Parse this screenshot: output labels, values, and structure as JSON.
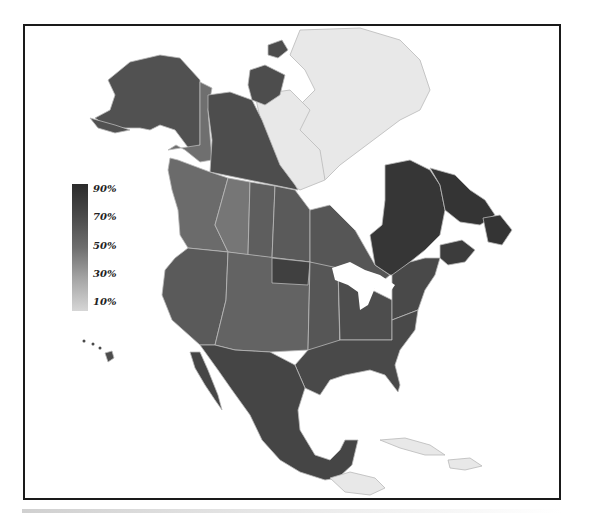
{
  "legend": {
    "labels": [
      "90%",
      "70%",
      "50%",
      "30%",
      "10%"
    ],
    "scale_min": 10,
    "scale_max": 90,
    "color_dark": "#2b2b2b",
    "color_light": "#d6d6d6"
  },
  "colors": {
    "frame": "#1a1a1a",
    "border": "#b9b9b9",
    "no_data": "#e8e8e8",
    "background": "#ffffff"
  },
  "regions": [
    {
      "name": "Alaska",
      "value": 72
    },
    {
      "name": "Yukon",
      "value": 58
    },
    {
      "name": "Northwest Territories",
      "value": 74
    },
    {
      "name": "Nunavut",
      "value": null
    },
    {
      "name": "British Columbia",
      "value": 60
    },
    {
      "name": "Alberta",
      "value": 55
    },
    {
      "name": "Saskatchewan",
      "value": 66
    },
    {
      "name": "Manitoba",
      "value": 68
    },
    {
      "name": "Ontario",
      "value": 70
    },
    {
      "name": "Quebec",
      "value": 85
    },
    {
      "name": "Newfoundland and Labrador",
      "value": 86
    },
    {
      "name": "Maritimes",
      "value": 82
    },
    {
      "name": "US West",
      "value": 68
    },
    {
      "name": "US Mountain",
      "value": 64
    },
    {
      "name": "North Dakota",
      "value": 80
    },
    {
      "name": "US Plains",
      "value": 70
    },
    {
      "name": "US Midwest",
      "value": 74
    },
    {
      "name": "US Northeast",
      "value": 76
    },
    {
      "name": "US South",
      "value": 76
    },
    {
      "name": "Hawaii",
      "value": 74
    },
    {
      "name": "Mexico",
      "value": 78
    },
    {
      "name": "Central America",
      "value": null
    },
    {
      "name": "Caribbean",
      "value": null
    }
  ]
}
